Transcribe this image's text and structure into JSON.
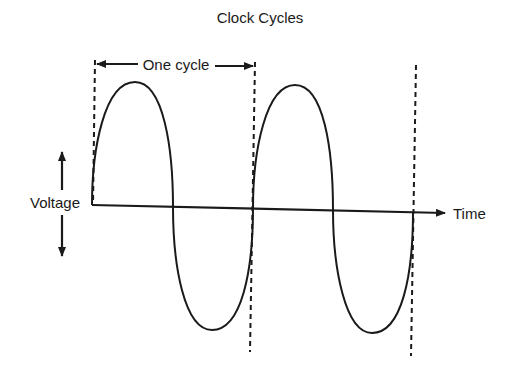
{
  "title": "Clock Cycles",
  "labels": {
    "cycle": "One cycle",
    "y_axis": "Voltage",
    "x_axis": "Time"
  },
  "diagram": {
    "type": "waveform",
    "waves": 2,
    "stroke_color": "#1a1a1a",
    "background": "#ffffff"
  }
}
